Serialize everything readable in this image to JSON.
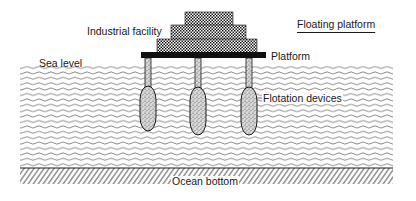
{
  "diagram": {
    "title": "Floating platform",
    "labels": {
      "facility": "Industrial facility",
      "platform": "Platform",
      "sea_level": "Sea level",
      "flotation": "Flotation devices",
      "ocean_bottom": "Ocean bottom"
    },
    "components": {
      "facility_tiers": 3,
      "support_columns": 3,
      "flotation_devices": 3
    },
    "colors": {
      "ink": "#1a1a1a",
      "water_lines": "#555555",
      "background": "#ffffff"
    }
  }
}
